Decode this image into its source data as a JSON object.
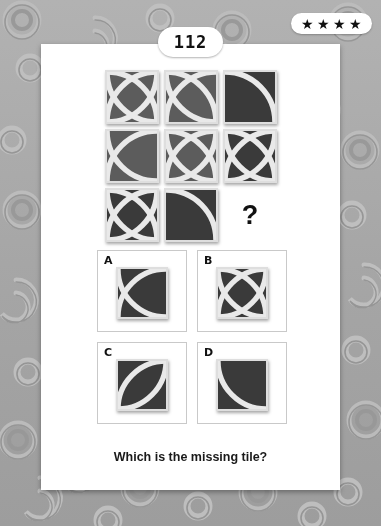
{
  "page": {
    "number": "112",
    "difficulty_stars": 4,
    "star_glyph": "★"
  },
  "background": {
    "color": "#a8a8a8",
    "pattern": "embossed-spirals"
  },
  "card": {
    "background": "#ffffff"
  },
  "puzzle": {
    "type": "missing-tile-matrix",
    "caption": "Which is the missing tile?",
    "question_mark": "?",
    "tile_colors": {
      "light": "#5c5c5c",
      "dark": "#3a3a3a",
      "line": "#e9e9e9",
      "border": "#dedede"
    },
    "grid": {
      "rows": 3,
      "cols": 3,
      "cells": [
        {
          "pos": "r1c1",
          "shade": "light",
          "arcs": [
            "tl",
            "br",
            "tr",
            "bl"
          ],
          "label": "four-arc-crossing"
        },
        {
          "pos": "r1c2",
          "shade": "light",
          "arcs": [
            "tl",
            "br",
            "tr"
          ],
          "label": "three-arc-crossing"
        },
        {
          "pos": "r1c3",
          "shade": "dark",
          "arcs": [
            "tl"
          ],
          "label": "single-arc-top-left"
        },
        {
          "pos": "r2c1",
          "shade": "light",
          "arcs": [
            "tr",
            "br"
          ],
          "label": "two-arc-left-lens"
        },
        {
          "pos": "r2c2",
          "shade": "light",
          "arcs": [
            "tl",
            "tr",
            "bl",
            "br"
          ],
          "label": "four-arc-rosette"
        },
        {
          "pos": "r2c3",
          "shade": "dark",
          "arcs": [
            "tl",
            "bl",
            "tr",
            "br"
          ],
          "label": "four-arc-crossing"
        },
        {
          "pos": "r3c1",
          "shade": "dark",
          "arcs": [
            "tl",
            "tr",
            "bl",
            "br"
          ],
          "label": "four-arc-crossing"
        },
        {
          "pos": "r3c2",
          "shade": "dark",
          "arcs": [
            "tl"
          ],
          "label": "single-arc-top-left"
        },
        {
          "pos": "r3c3",
          "shade": "missing",
          "arcs": [],
          "label": "missing-cell"
        }
      ]
    },
    "options": [
      {
        "letter": "A",
        "shade": "dark",
        "arcs": [
          "tr",
          "br"
        ],
        "label": "two-arc-left-lens"
      },
      {
        "letter": "B",
        "shade": "dark",
        "arcs": [
          "tl",
          "tr",
          "bl",
          "br"
        ],
        "label": "four-arc-rosette"
      },
      {
        "letter": "C",
        "shade": "dark",
        "arcs": [
          "tr",
          "bl"
        ],
        "label": "diagonal-lens"
      },
      {
        "letter": "D",
        "shade": "dark",
        "arcs": [
          "bl"
        ],
        "label": "single-arc-bottom-left"
      }
    ]
  }
}
